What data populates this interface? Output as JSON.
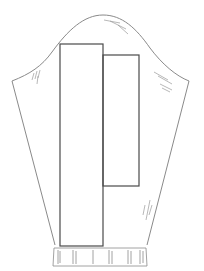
{
  "diagram": {
    "title": "Sleeve pattern piece with overlapping rectangles",
    "colors": {
      "outline": "#8a8a8a",
      "rect": "#4a4a4a",
      "background": "#ffffff",
      "hatch": "#9a9a9a"
    },
    "sleeve": {
      "cap_top": [
        103,
        15
      ],
      "left_underarm": [
        12,
        81
      ],
      "right_underarm": [
        189,
        81
      ],
      "left_hem": [
        55,
        245
      ],
      "right_hem": [
        147,
        245
      ]
    },
    "rectangles": [
      {
        "name": "left-rectangle",
        "x": 60,
        "y": 44,
        "width": 43,
        "height": 202
      },
      {
        "name": "right-rectangle",
        "x": 103,
        "y": 55,
        "width": 36,
        "height": 131
      }
    ],
    "cuff": {
      "x": 53,
      "y": 248,
      "width": 94,
      "height": 18,
      "ribs": 6
    }
  }
}
